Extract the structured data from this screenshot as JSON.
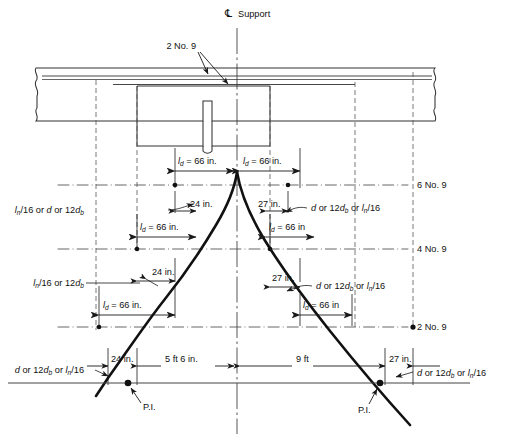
{
  "figure": {
    "title_centerline": "Support",
    "centerline_symbol": "℄",
    "domain": "reinforced-concrete-beam-bar-cutoff-detail"
  },
  "annotations": {
    "top_bars_callout": "2 No. 9",
    "right_labels": [
      {
        "name": "top-layer",
        "text": "6 No. 9"
      },
      {
        "name": "mid-layer",
        "text": "4 No. 9"
      },
      {
        "name": "bottom-layer",
        "text": "2 No. 9"
      }
    ],
    "ld_dimensions": [
      {
        "name": "ld-top-left",
        "text": "l d = 66 in.",
        "base": "l",
        "sub": "d",
        "rest": " = 66 in."
      },
      {
        "name": "ld-top-right",
        "text": "l d = 66 in.",
        "base": "l",
        "sub": "d",
        "rest": " = 66 in."
      },
      {
        "name": "ld-mid-left",
        "text": "l d = 66 in.",
        "base": "l",
        "sub": "d",
        "rest": " = 66 in."
      },
      {
        "name": "ld-mid-right",
        "text": "l d = 66 in",
        "base": "l",
        "sub": "d",
        "rest": " = 66 in"
      },
      {
        "name": "ld-low-left",
        "text": "l d = 66 in.",
        "base": "l",
        "sub": "d",
        "rest": " = 66 in."
      },
      {
        "name": "ld-low-right",
        "text": "l d = 66 in",
        "base": "l",
        "sub": "d",
        "rest": " = 66 in"
      }
    ],
    "extension_dimensions": [
      {
        "name": "ext-upper-left",
        "text": "24 in."
      },
      {
        "name": "ext-upper-right",
        "text": "27 in."
      },
      {
        "name": "ext-lower-left",
        "text": "24 in."
      },
      {
        "name": "ext-lower-right",
        "text": "27 in."
      },
      {
        "name": "ext-base-left",
        "text": "24 in."
      },
      {
        "name": "ext-base-right",
        "text": "27 in."
      }
    ],
    "criteria_labels": [
      {
        "name": "criteria-upper-left",
        "parts": [
          {
            "t": "l",
            "style": "italic"
          },
          {
            "t": "n",
            "style": "sub-italic"
          },
          {
            "t": "/16 or ",
            "style": "roman"
          },
          {
            "t": "d",
            "style": "italic"
          },
          {
            "t": " or 12",
            "style": "roman"
          },
          {
            "t": "d",
            "style": "italic"
          },
          {
            "t": "b",
            "style": "sub-italic"
          }
        ],
        "plain": "ln/16 or d or 12db"
      },
      {
        "name": "criteria-upper-right",
        "parts": [
          {
            "t": "d",
            "style": "italic"
          },
          {
            "t": " or 12",
            "style": "roman"
          },
          {
            "t": "d",
            "style": "italic"
          },
          {
            "t": "b",
            "style": "sub-italic"
          },
          {
            "t": " or ",
            "style": "roman"
          },
          {
            "t": "l",
            "style": "italic"
          },
          {
            "t": "n",
            "style": "sub-italic"
          },
          {
            "t": "/16",
            "style": "roman"
          }
        ],
        "plain": "d or 12db or ln/16"
      },
      {
        "name": "criteria-lower-left",
        "parts": [
          {
            "t": "l",
            "style": "italic"
          },
          {
            "t": "n",
            "style": "sub-italic"
          },
          {
            "t": "/16 or 12",
            "style": "roman"
          },
          {
            "t": "d",
            "style": "italic"
          },
          {
            "t": "b",
            "style": "sub-italic"
          }
        ],
        "plain": "ln/16 or 12db"
      },
      {
        "name": "criteria-lower-right",
        "parts": [
          {
            "t": "d",
            "style": "italic"
          },
          {
            "t": " or 12",
            "style": "roman"
          },
          {
            "t": "d",
            "style": "italic"
          },
          {
            "t": "b",
            "style": "sub-italic"
          },
          {
            "t": " or ",
            "style": "roman"
          },
          {
            "t": "l",
            "style": "italic"
          },
          {
            "t": "n",
            "style": "sub-italic"
          },
          {
            "t": "/16",
            "style": "roman"
          }
        ],
        "plain": "d or 12db or ln/16"
      },
      {
        "name": "criteria-base-left",
        "parts": [
          {
            "t": "d",
            "style": "italic"
          },
          {
            "t": " or 12",
            "style": "roman"
          },
          {
            "t": "d",
            "style": "italic"
          },
          {
            "t": "b",
            "style": "sub-italic"
          },
          {
            "t": " or ",
            "style": "roman"
          },
          {
            "t": "l",
            "style": "italic"
          },
          {
            "t": "n",
            "style": "sub-italic"
          },
          {
            "t": "/16",
            "style": "roman"
          }
        ],
        "plain": "d or 12db or ln/16"
      },
      {
        "name": "criteria-base-right",
        "parts": [
          {
            "t": "d",
            "style": "italic"
          },
          {
            "t": " or 12",
            "style": "roman"
          },
          {
            "t": "d",
            "style": "italic"
          },
          {
            "t": "b",
            "style": "sub-italic"
          },
          {
            "t": " or ",
            "style": "roman"
          },
          {
            "t": "l",
            "style": "italic"
          },
          {
            "t": "n",
            "style": "sub-italic"
          },
          {
            "t": "/16",
            "style": "roman"
          }
        ],
        "plain": "d or 12db or ln/16"
      }
    ],
    "span_dimensions": [
      {
        "name": "span-left",
        "text": "5 ft 6 in."
      },
      {
        "name": "span-right",
        "text": "9 ft"
      }
    ],
    "inflection_points": [
      {
        "name": "pi-left",
        "text": "P.I."
      },
      {
        "name": "pi-right",
        "text": "P.I."
      }
    ]
  },
  "colors": {
    "line": "#1a1a1a",
    "thin": "#333333",
    "dash": "#555555",
    "moment_curve": "#111111",
    "background": "#ffffff"
  }
}
